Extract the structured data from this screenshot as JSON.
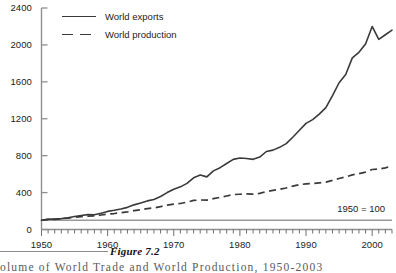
{
  "figure": {
    "caption_label": "Figure 7.2",
    "caption_text": "olume of World Trade and World Production, 1950-2003"
  },
  "legend": {
    "position": "top-left",
    "entries": [
      {
        "label": "World exports",
        "style": "solid",
        "color": "#3a3a3a"
      },
      {
        "label": "World production",
        "style": "dashed",
        "color": "#3a3a3a"
      }
    ]
  },
  "annotation": {
    "base_note": "1950 = 100"
  },
  "axes": {
    "y_ticks": [
      "0",
      "400",
      "800",
      "1200",
      "1600",
      "2000",
      "2400"
    ],
    "x_ticks": [
      "1950",
      "1960",
      "1970",
      "1980",
      "1990",
      "2000"
    ]
  },
  "chart_data": {
    "type": "line",
    "title": "",
    "subtitle": "",
    "xlabel": "",
    "ylabel": "",
    "xlim": [
      1950,
      2003
    ],
    "ylim": [
      0,
      2400
    ],
    "ytick_step": 400,
    "grid": false,
    "legend_position": "top-left",
    "annotations": [
      {
        "text": "1950 = 100",
        "x": 1998,
        "y": 190
      }
    ],
    "reference_lines": [
      {
        "value": 100,
        "orientation": "horizontal",
        "color": "#9a9a9a"
      }
    ],
    "x": [
      1950,
      1951,
      1952,
      1953,
      1954,
      1955,
      1956,
      1957,
      1958,
      1959,
      1960,
      1961,
      1962,
      1963,
      1964,
      1965,
      1966,
      1967,
      1968,
      1969,
      1970,
      1971,
      1972,
      1973,
      1974,
      1975,
      1976,
      1977,
      1978,
      1979,
      1980,
      1981,
      1982,
      1983,
      1984,
      1985,
      1986,
      1987,
      1988,
      1989,
      1990,
      1991,
      1992,
      1993,
      1994,
      1995,
      1996,
      1997,
      1998,
      1999,
      2000,
      2001,
      2002,
      2003
    ],
    "series": [
      {
        "name": "World exports",
        "style": "solid",
        "color": "#3a3a3a",
        "values": [
          100,
          112,
          112,
          118,
          127,
          140,
          152,
          161,
          160,
          176,
          196,
          208,
          222,
          240,
          267,
          288,
          310,
          325,
          358,
          400,
          436,
          462,
          500,
          560,
          590,
          570,
          635,
          670,
          715,
          760,
          775,
          770,
          760,
          785,
          845,
          860,
          890,
          930,
          1000,
          1075,
          1150,
          1190,
          1250,
          1320,
          1450,
          1590,
          1680,
          1860,
          1920,
          2010,
          2200,
          2060,
          2110,
          2160
        ]
      },
      {
        "name": "World production",
        "style": "dashed",
        "color": "#3a3a3a",
        "values": [
          100,
          106,
          110,
          117,
          123,
          132,
          139,
          145,
          147,
          157,
          166,
          173,
          182,
          191,
          204,
          215,
          226,
          234,
          248,
          264,
          274,
          282,
          296,
          315,
          320,
          318,
          335,
          348,
          363,
          378,
          382,
          385,
          383,
          392,
          412,
          423,
          435,
          450,
          470,
          485,
          495,
          498,
          505,
          513,
          533,
          553,
          570,
          592,
          605,
          622,
          650,
          655,
          668,
          690
        ]
      }
    ]
  }
}
